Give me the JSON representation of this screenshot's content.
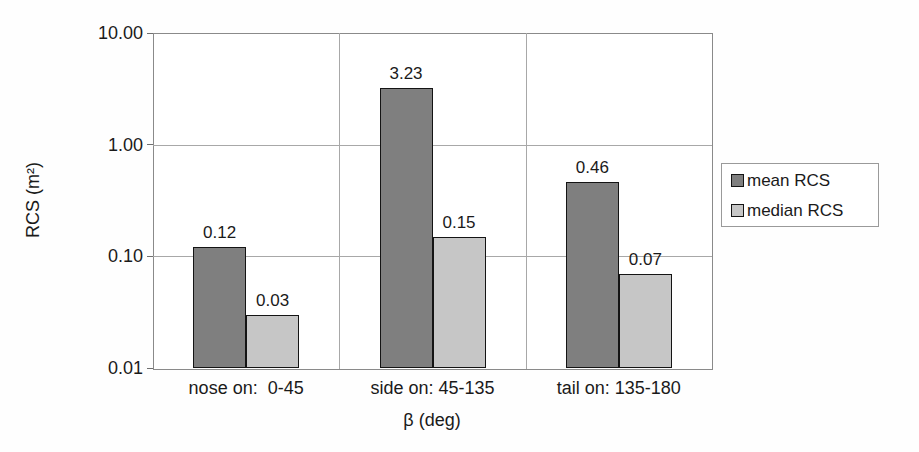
{
  "figure": {
    "y_axis_title": "RCS (m²)",
    "x_axis_title": "β (deg)"
  },
  "legend": {
    "items": [
      {
        "label": "mean RCS",
        "color": "#7f7f7f"
      },
      {
        "label": "median RCS",
        "color": "#c6c6c6"
      }
    ]
  },
  "chart_data": {
    "type": "bar",
    "scale": "log",
    "title": "",
    "xlabel": "β (deg)",
    "ylabel": "RCS (m²)",
    "ylim": [
      0.01,
      10
    ],
    "y_ticks": [
      {
        "value": 10,
        "label": "10.00"
      },
      {
        "value": 1,
        "label": "1.00"
      },
      {
        "value": 0.1,
        "label": "0.10"
      },
      {
        "value": 0.01,
        "label": "0.01"
      }
    ],
    "categories": [
      "nose on:  0-45",
      "side on: 45-135",
      "tail on: 135-180"
    ],
    "series": [
      {
        "name": "mean RCS",
        "color": "#7f7f7f",
        "values": [
          0.12,
          3.23,
          0.46
        ],
        "labels": [
          "0.12",
          "3.23",
          "0.46"
        ]
      },
      {
        "name": "median RCS",
        "color": "#c6c6c6",
        "values": [
          0.03,
          0.15,
          0.07
        ],
        "labels": [
          "0.03",
          "0.15",
          "0.07"
        ]
      }
    ],
    "grid": true,
    "legend_position": "right"
  }
}
